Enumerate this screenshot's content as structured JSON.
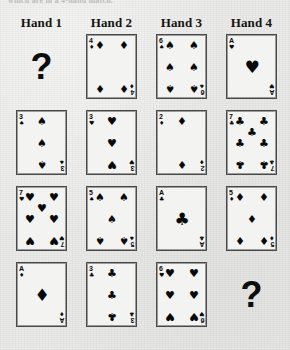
{
  "caption": {
    "clipped_text": "which are in a 4-hand match."
  },
  "headers": [
    {
      "label": "Hand 1"
    },
    {
      "label": "Hand 2"
    },
    {
      "label": "Hand 3"
    },
    {
      "label": "Hand 4"
    }
  ],
  "symbols": {
    "spade": "♠",
    "heart": "♥",
    "diamond": "♦",
    "club": "♣",
    "question": "?"
  },
  "colors": {
    "paper": "#e9e9e7",
    "card_face": "#f3f3f1",
    "card_border": "#4a4a4a",
    "ink": "#0a0a0a"
  },
  "grid": {
    "rows": 4,
    "columns": 4,
    "card_width": 51,
    "card_height": 65,
    "column_x": [
      16,
      86,
      156,
      226
    ],
    "row_y": [
      34,
      110,
      186,
      262
    ]
  },
  "cells": [
    {
      "row": 1,
      "column": 1,
      "hand": "Hand 1",
      "type": "unknown",
      "label": "?"
    },
    {
      "row": 1,
      "column": 2,
      "hand": "Hand 2",
      "type": "card",
      "rank": "4",
      "suit": "diamond",
      "suit_symbol": "♦",
      "label": "4 of diamonds",
      "pip_count": 4
    },
    {
      "row": 1,
      "column": 3,
      "hand": "Hand 3",
      "type": "card",
      "rank": "6",
      "suit": "spade",
      "suit_symbol": "♠",
      "label": "6 of spades",
      "pip_count": 6
    },
    {
      "row": 1,
      "column": 4,
      "hand": "Hand 4",
      "type": "card",
      "rank": "A",
      "suit": "heart",
      "suit_symbol": "♥",
      "label": "Ace of hearts",
      "pip_count": 1
    },
    {
      "row": 2,
      "column": 1,
      "hand": "Hand 1",
      "type": "card",
      "rank": "3",
      "suit": "spade",
      "suit_symbol": "♠",
      "label": "3 of spades",
      "pip_count": 3
    },
    {
      "row": 2,
      "column": 2,
      "hand": "Hand 2",
      "type": "card",
      "rank": "3",
      "suit": "heart",
      "suit_symbol": "♥",
      "label": "3 of hearts",
      "pip_count": 3
    },
    {
      "row": 2,
      "column": 3,
      "hand": "Hand 3",
      "type": "card",
      "rank": "2",
      "suit": "diamond",
      "suit_symbol": "♦",
      "label": "2 of diamonds",
      "pip_count": 2
    },
    {
      "row": 2,
      "column": 4,
      "hand": "Hand 4",
      "type": "card",
      "rank": "7",
      "suit": "club",
      "suit_symbol": "♣",
      "label": "7 of clubs",
      "pip_count": 7
    },
    {
      "row": 3,
      "column": 1,
      "hand": "Hand 1",
      "type": "card",
      "rank": "7",
      "suit": "heart",
      "suit_symbol": "♥",
      "label": "7 of hearts",
      "pip_count": 7
    },
    {
      "row": 3,
      "column": 2,
      "hand": "Hand 2",
      "type": "card",
      "rank": "5",
      "suit": "spade",
      "suit_symbol": "♠",
      "label": "5 of spades",
      "pip_count": 5
    },
    {
      "row": 3,
      "column": 3,
      "hand": "Hand 3",
      "type": "card",
      "rank": "A",
      "suit": "club",
      "suit_symbol": "♣",
      "label": "Ace of clubs",
      "pip_count": 1
    },
    {
      "row": 3,
      "column": 4,
      "hand": "Hand 4",
      "type": "card",
      "rank": "5",
      "suit": "diamond",
      "suit_symbol": "♦",
      "label": "5 of diamonds",
      "pip_count": 5
    },
    {
      "row": 4,
      "column": 1,
      "hand": "Hand 1",
      "type": "card",
      "rank": "A",
      "suit": "diamond",
      "suit_symbol": "♦",
      "label": "Ace of diamonds",
      "pip_count": 1
    },
    {
      "row": 4,
      "column": 2,
      "hand": "Hand 2",
      "type": "card",
      "rank": "3",
      "suit": "club",
      "suit_symbol": "♣",
      "label": "3 of clubs",
      "pip_count": 3
    },
    {
      "row": 4,
      "column": 3,
      "hand": "Hand 3",
      "type": "card",
      "rank": "6",
      "suit": "heart",
      "suit_symbol": "♥",
      "label": "6 of hearts",
      "pip_count": 6
    },
    {
      "row": 4,
      "column": 4,
      "hand": "Hand 4",
      "type": "unknown",
      "label": "?"
    }
  ]
}
